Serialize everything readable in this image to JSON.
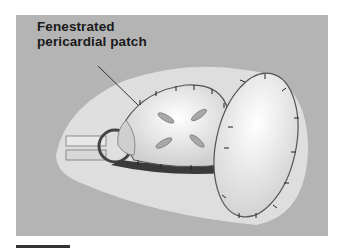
{
  "figure": {
    "label_line1": "Fenestrated",
    "label_line2": "pericardial patch",
    "colors": {
      "background": "#b4b4b4",
      "tissue": "#e6e6e6",
      "patch": "#f2f2f2",
      "suture": "#2a2a2a"
    }
  }
}
